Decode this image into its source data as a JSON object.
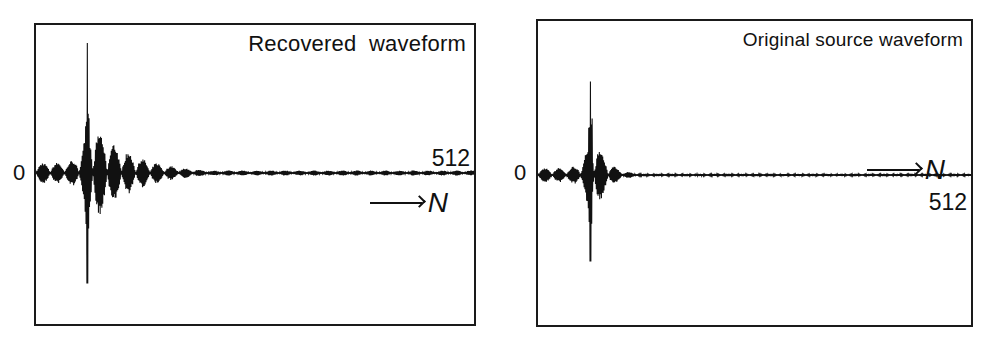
{
  "chart_data": [
    {
      "type": "line",
      "title": "Recovered waveform",
      "xlabel": "N",
      "ylabel": "",
      "x_axis_end_label": "512",
      "y_zero_label": "0",
      "xlim": [
        0,
        512
      ],
      "ylim": [
        -1,
        1
      ],
      "grid": false,
      "description": "Decaying oscillatory waveform with main spike near N≈60, ringing tail decaying until ~N≈200",
      "series": [
        {
          "name": "recovered",
          "peak_index": 60,
          "peak_positive": 1.0,
          "peak_negative": -0.85,
          "pre_ringing_amplitude": 0.08,
          "decay_end_index": 200,
          "tail_amplitude": 0.02
        }
      ]
    },
    {
      "type": "line",
      "title": "Original source waveform",
      "xlabel": "N",
      "ylabel": "",
      "x_axis_end_label": "512",
      "y_zero_label": "0",
      "xlim": [
        0,
        512
      ],
      "ylim": [
        -1,
        1
      ],
      "grid": false,
      "description": "Short pulse with main spike near N≈62, brief ringing on both sides",
      "series": [
        {
          "name": "source",
          "peak_index": 62,
          "peak_positive": 0.78,
          "peak_negative": -0.72,
          "pre_ringing_amplitude": 0.06,
          "decay_end_index": 110,
          "tail_amplitude": 0.01
        }
      ]
    }
  ],
  "labels": {
    "left_title": "Recovered  waveform",
    "right_title": "Original source waveform",
    "zero": "0",
    "n_end": "512",
    "axis_var": "N"
  }
}
